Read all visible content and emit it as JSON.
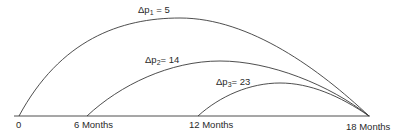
{
  "diagram": {
    "type": "overlapping-time-arcs",
    "axis": {
      "ticks": [
        {
          "label": "0",
          "x": 19
        },
        {
          "label": "6 Months",
          "x": 87
        },
        {
          "label": "12 Months",
          "x": 198
        },
        {
          "label": "18 Months",
          "x": 369
        }
      ]
    },
    "arcs": [
      {
        "id": "arc-1",
        "start_label": "0",
        "end_label": "18 Months",
        "delta_symbol": "Δp",
        "subscript": "1",
        "value": "5",
        "equals": " = "
      },
      {
        "id": "arc-2",
        "start_label": "6 Months",
        "end_label": "18 Months",
        "delta_symbol": "Δp",
        "subscript": "2",
        "value": "14",
        "equals": "= "
      },
      {
        "id": "arc-3",
        "start_label": "12 Months",
        "end_label": "18 Months",
        "delta_symbol": "Δp",
        "subscript": "3",
        "value": "23",
        "equals": "= "
      }
    ],
    "colors": {
      "line": "#3a3a3a",
      "text": "#2a2a2a",
      "background": "#ffffff"
    }
  }
}
